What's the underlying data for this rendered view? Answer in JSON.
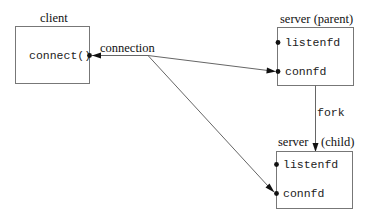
{
  "diagram": {
    "type": "process-connection-diagram",
    "nodes": {
      "client": {
        "title": "client",
        "items": [
          "connect()"
        ]
      },
      "server_parent": {
        "title": "server (parent)",
        "items": [
          "listenfd",
          "connfd"
        ]
      },
      "server_child": {
        "title_left": "server",
        "title_right": "(child)",
        "items": [
          "listenfd",
          "connfd"
        ]
      }
    },
    "edges": [
      {
        "from": "client.connect()",
        "to": "server_parent.connfd",
        "label": "connection",
        "bidirectional": true
      },
      {
        "from": "connection",
        "to": "server_child.connfd",
        "label": ""
      },
      {
        "from": "server_parent",
        "to": "server_child",
        "label": "fork"
      }
    ],
    "labels": {
      "connection": "connection",
      "fork": "fork"
    }
  }
}
